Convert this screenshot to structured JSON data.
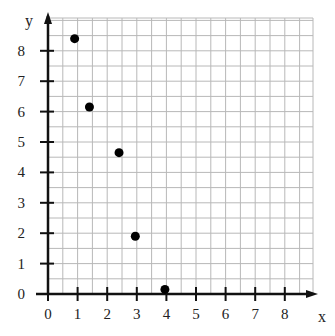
{
  "chart_data": {
    "type": "scatter",
    "title": "",
    "xlabel": "x",
    "ylabel": "y",
    "xlim": [
      0,
      8.9
    ],
    "ylim": [
      0,
      9.2
    ],
    "x_ticks": [
      0,
      1,
      2,
      3,
      4,
      5,
      6,
      7,
      8
    ],
    "y_ticks": [
      0,
      1,
      2,
      3,
      4,
      5,
      6,
      7,
      8
    ],
    "grid": true,
    "grid_step": 0.5,
    "legend": null,
    "series": [
      {
        "name": "points",
        "color": "#000000",
        "points": [
          {
            "x": 0.9,
            "y": 8.4
          },
          {
            "x": 1.4,
            "y": 6.15
          },
          {
            "x": 2.4,
            "y": 4.65
          },
          {
            "x": 2.95,
            "y": 1.9
          },
          {
            "x": 3.95,
            "y": 0.15
          }
        ]
      }
    ]
  },
  "colors": {
    "grid": "#b8b8b8",
    "axis": "#111111",
    "point": "#000000"
  }
}
